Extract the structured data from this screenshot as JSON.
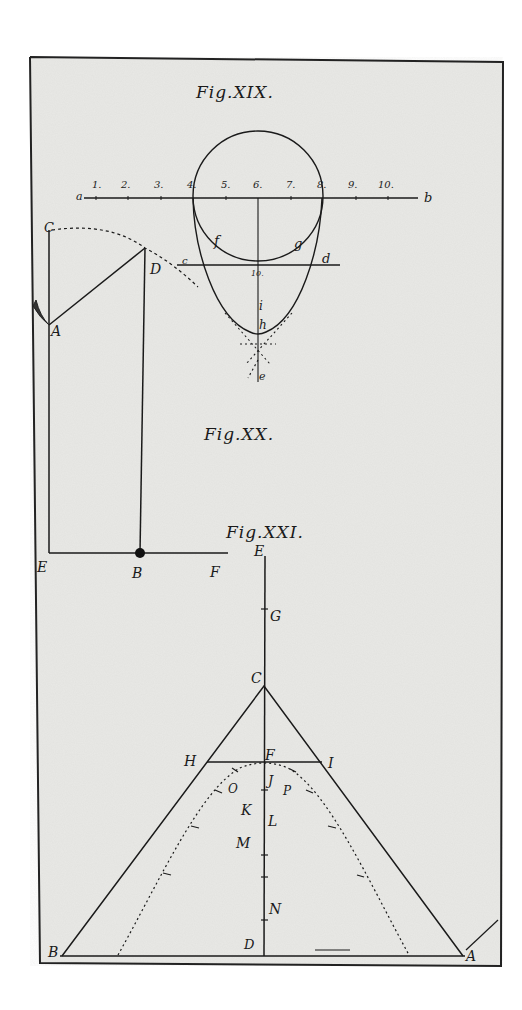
{
  "plate": {
    "paper_color": "#e9e9e6",
    "ink_color": "#1a1a1a",
    "border_color": "#222222"
  },
  "fig19": {
    "caption": "Fig.XIX.",
    "scale_start": "a",
    "scale_end": "b",
    "scale_ticks": [
      "1.",
      "2.",
      "3.",
      "4.",
      "5.",
      "6.",
      "7.",
      "8.",
      "9.",
      "10."
    ],
    "labels": {
      "c": "c",
      "d": "d",
      "f": "f",
      "g": "g",
      "ten": "10.",
      "i": "i",
      "h": "h",
      "e": "e"
    }
  },
  "fig20": {
    "caption": "Fig.XX.",
    "labels": {
      "C": "C",
      "D": "D",
      "A": "A",
      "E": "E",
      "B": "B",
      "F": "F"
    }
  },
  "fig21": {
    "caption": "Fig.XXI.",
    "labels": {
      "E": "E",
      "G": "G",
      "C": "C",
      "H": "H",
      "F": "F",
      "I": "I",
      "J": "J",
      "O": "O",
      "P": "P",
      "K": "K",
      "L": "L",
      "M": "M",
      "N": "N",
      "D": "D",
      "B": "B",
      "A": "A"
    }
  }
}
